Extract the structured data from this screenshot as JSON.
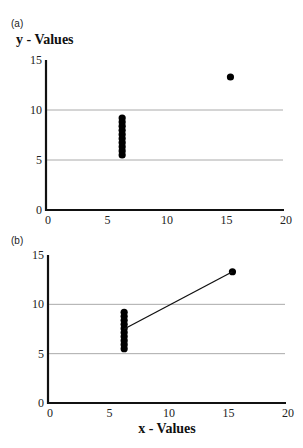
{
  "chart_data": [
    {
      "panel": "(a)",
      "type": "scatter",
      "title": "",
      "ylabel": "y - Values",
      "xlabel": "",
      "xlim": [
        0,
        20
      ],
      "ylim": [
        0,
        15
      ],
      "xticks": [
        0,
        5,
        10,
        15,
        20
      ],
      "yticks": [
        0,
        5,
        10,
        15
      ],
      "grid": {
        "horizontal": [
          5,
          10
        ],
        "vertical": false
      },
      "legend": null,
      "series": [
        {
          "name": "points",
          "x": [
            6.4,
            6.4,
            6.4,
            6.4,
            6.4,
            6.4,
            6.4,
            6.4,
            6.4,
            6.4,
            15.5
          ],
          "y": [
            5.5,
            5.91,
            6.32,
            6.73,
            7.14,
            7.56,
            7.97,
            8.38,
            8.79,
            9.2,
            13.3
          ]
        }
      ]
    },
    {
      "panel": "(b)",
      "type": "scatter",
      "title": "",
      "ylabel": "",
      "xlabel": "x - Values",
      "xlim": [
        0,
        20
      ],
      "ylim": [
        0,
        15
      ],
      "xticks": [
        0,
        5,
        10,
        15,
        20
      ],
      "yticks": [
        0,
        5,
        10,
        15
      ],
      "grid": {
        "horizontal": [
          5,
          10
        ],
        "vertical": false
      },
      "legend": null,
      "series": [
        {
          "name": "points",
          "x": [
            6.4,
            6.4,
            6.4,
            6.4,
            6.4,
            6.4,
            6.4,
            6.4,
            6.4,
            6.4,
            15.5
          ],
          "y": [
            5.5,
            5.91,
            6.32,
            6.73,
            7.14,
            7.56,
            7.97,
            8.38,
            8.79,
            9.2,
            13.3
          ]
        },
        {
          "name": "line",
          "type": "line",
          "x": [
            6.4,
            15.5
          ],
          "y": [
            7.5,
            13.3
          ]
        }
      ]
    }
  ],
  "labels": {
    "panel_a": "(a)",
    "panel_b": "(b)",
    "y_title": "y - Values",
    "x_title": "x - Values"
  },
  "colors": {
    "points": "#000000",
    "axis": "#111111",
    "grid": "#aaaaaa"
  }
}
